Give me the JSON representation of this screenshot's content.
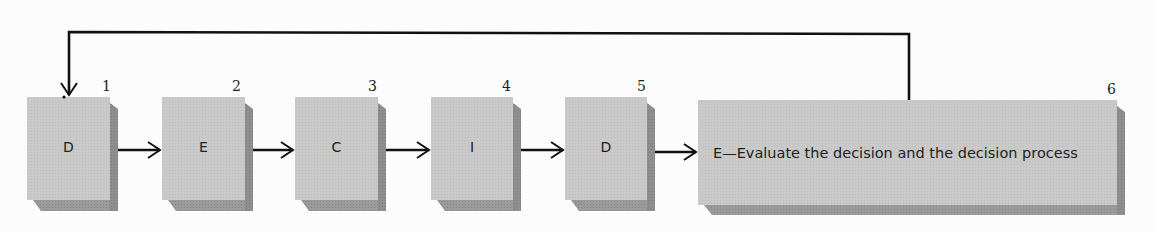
{
  "diagram": {
    "steps": [
      {
        "number": "1",
        "letter": "D"
      },
      {
        "number": "2",
        "letter": "E"
      },
      {
        "number": "3",
        "letter": "C"
      },
      {
        "number": "4",
        "letter": "I"
      },
      {
        "number": "5",
        "letter": "D"
      },
      {
        "number": "6",
        "letter": "E",
        "text": "E—Evaluate the decision and the decision process"
      }
    ],
    "feedback_loop": {
      "from_step": "6",
      "to_step": "1"
    },
    "colors": {
      "box_face": "#c9c9c9",
      "box_shadow": "#8e8e8e",
      "arrow": "#111111",
      "background": "#fcfcfc"
    }
  }
}
